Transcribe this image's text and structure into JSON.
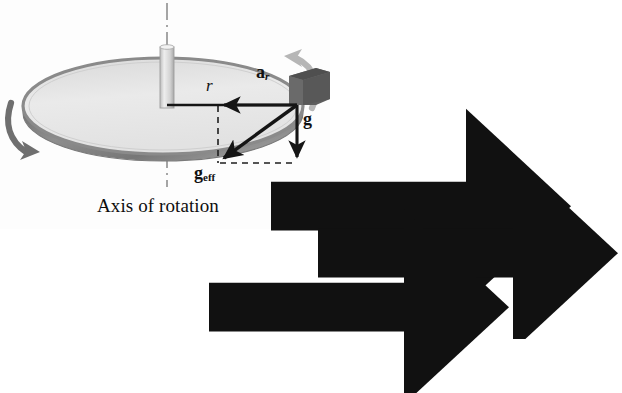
{
  "figure": {
    "caption": "Axis of rotation",
    "colors": {
      "disk_top": "#e9e9e9",
      "disk_rim": "#808080",
      "disk_rim_dark": "#5f5f5f",
      "block": "#6b6b6b",
      "block_top": "#565656",
      "spindle": "#d8d8d8",
      "spindle_edge": "#9a9a9a",
      "arrow_dark": "#151515",
      "spin_arrow_left": "#6e6e6e",
      "spin_arrow_right": "#b4b4b4",
      "axis_line": "#8c8c8c",
      "dashed": "#1a1a1a",
      "background": "#ffffff"
    },
    "labels": [
      {
        "id": "radius",
        "text": "r",
        "kind": "italic",
        "x": 206,
        "y": 84,
        "meaning": "radius from axis of rotation to block"
      },
      {
        "id": "radial-acceleration",
        "base": "a",
        "subscript": "r",
        "has_vector_arrow": true,
        "x": 257,
        "y": 72,
        "meaning": "radial (centripetal) acceleration vector"
      },
      {
        "id": "gravity",
        "base": "g",
        "subscript": "",
        "has_vector_arrow": true,
        "x": 303,
        "y": 117,
        "meaning": "gravitational acceleration vector"
      },
      {
        "id": "effective-gravity",
        "base": "g",
        "subscript": "eff",
        "has_vector_arrow": true,
        "x": 196,
        "y": 172,
        "meaning": "effective gravity vector (vector sum of g and a_r)"
      }
    ],
    "vectors": [
      {
        "id": "a_r",
        "label": "a_r",
        "from": [
          297,
          105
        ],
        "to": [
          218,
          105
        ],
        "direction": "left",
        "style": "solid-bold"
      },
      {
        "id": "g",
        "label": "g",
        "from": [
          297,
          105
        ],
        "to": [
          297,
          163
        ],
        "direction": "down",
        "style": "solid-bold"
      },
      {
        "id": "g_eff",
        "label": "g_eff",
        "from": [
          297,
          105
        ],
        "to": [
          218,
          162
        ],
        "direction": "down-left",
        "style": "solid-bold"
      }
    ],
    "construction_lines": [
      {
        "id": "vertical-dashed",
        "from": [
          218,
          105
        ],
        "to": [
          218,
          163
        ],
        "style": "dashed"
      },
      {
        "id": "horizontal-dashed",
        "from": [
          218,
          163
        ],
        "to": [
          297,
          163
        ],
        "style": "dashed"
      }
    ],
    "axis": {
      "id": "rotation-axis",
      "style": "dash-dot",
      "x": 167,
      "segments": [
        [
          3,
          47
        ],
        [
          151,
          186
        ]
      ]
    },
    "disk": {
      "cx": 163,
      "cy": 106,
      "rx": 140,
      "ry": 48,
      "thickness": 7
    },
    "spindle": {
      "x": 160,
      "y_top": 45,
      "y_bottom": 108,
      "width": 15
    },
    "block": {
      "x": 290,
      "y": 75,
      "width": 37,
      "height": 30,
      "position": "on disk rim at radius r"
    },
    "spin_arrows": [
      {
        "id": "spin-arrow-left",
        "position": "left",
        "direction": "clockwise-toward-viewer"
      },
      {
        "id": "spin-arrow-right",
        "position": "right",
        "direction": "away-from-viewer"
      }
    ]
  }
}
